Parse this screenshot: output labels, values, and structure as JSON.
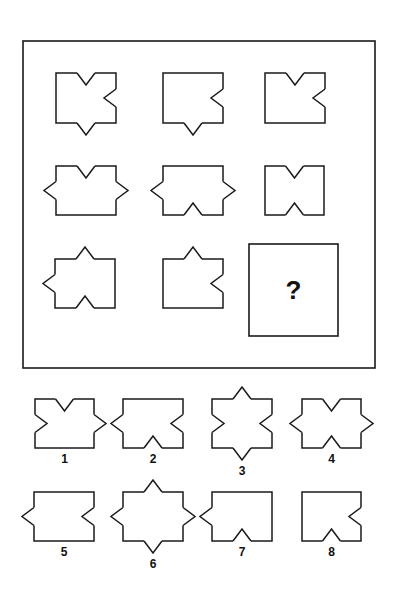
{
  "puzzle": {
    "stroke_color": "#1a1a1a",
    "background": "#ffffff",
    "question_mark": "?",
    "frame": {
      "x": 23,
      "y": 41,
      "w": 352,
      "h": 327
    },
    "question_box": {
      "x": 249,
      "y": 244,
      "w": 89,
      "h": 92
    },
    "matrix": [
      {
        "row": 1,
        "col": 1,
        "x": 56,
        "y": 73,
        "w": 60,
        "h": 50,
        "marks": [
          "top-in",
          "right-in",
          "bottom-out"
        ]
      },
      {
        "row": 1,
        "col": 2,
        "x": 163,
        "y": 73,
        "w": 60,
        "h": 50,
        "marks": [
          "right-in",
          "bottom-out"
        ]
      },
      {
        "row": 1,
        "col": 3,
        "x": 265,
        "y": 73,
        "w": 60,
        "h": 50,
        "marks": [
          "top-in",
          "right-in"
        ]
      },
      {
        "row": 2,
        "col": 1,
        "x": 56,
        "y": 166,
        "w": 60,
        "h": 49,
        "marks": [
          "top-in",
          "left-out",
          "right-out"
        ]
      },
      {
        "row": 2,
        "col": 2,
        "x": 163,
        "y": 166,
        "w": 60,
        "h": 49,
        "marks": [
          "left-out",
          "right-out",
          "bottom-in"
        ]
      },
      {
        "row": 2,
        "col": 3,
        "x": 265,
        "y": 166,
        "w": 59,
        "h": 49,
        "marks": [
          "top-in",
          "bottom-in"
        ]
      },
      {
        "row": 3,
        "col": 1,
        "x": 55,
        "y": 259,
        "w": 60,
        "h": 49,
        "marks": [
          "top-out",
          "left-out",
          "bottom-in"
        ]
      },
      {
        "row": 3,
        "col": 2,
        "x": 163,
        "y": 259,
        "w": 60,
        "h": 49,
        "marks": [
          "top-out",
          "right-in"
        ]
      }
    ],
    "options": [
      {
        "label": "1",
        "x": 35,
        "y": 399,
        "w": 59,
        "h": 49,
        "marks": [
          "top-in",
          "left-in",
          "right-out"
        ]
      },
      {
        "label": "2",
        "x": 123,
        "y": 399,
        "w": 60,
        "h": 49,
        "marks": [
          "left-out",
          "right-in",
          "bottom-in"
        ]
      },
      {
        "label": "3",
        "x": 212,
        "y": 399,
        "w": 60,
        "h": 49,
        "marks": [
          "top-out",
          "left-in",
          "right-in",
          "bottom-out"
        ]
      },
      {
        "label": "4",
        "x": 302,
        "y": 399,
        "w": 59,
        "h": 49,
        "marks": [
          "top-in",
          "left-out",
          "right-out",
          "bottom-in"
        ]
      },
      {
        "label": "5",
        "x": 34,
        "y": 492,
        "w": 60,
        "h": 49,
        "marks": [
          "left-out",
          "right-in"
        ]
      },
      {
        "label": "6",
        "x": 123,
        "y": 492,
        "w": 60,
        "h": 49,
        "marks": [
          "top-out",
          "left-out",
          "right-out",
          "bottom-out"
        ]
      },
      {
        "label": "7",
        "x": 212,
        "y": 492,
        "w": 60,
        "h": 49,
        "marks": [
          "left-out",
          "bottom-in"
        ]
      },
      {
        "label": "8",
        "x": 302,
        "y": 492,
        "w": 59,
        "h": 49,
        "marks": [
          "right-in",
          "bottom-in"
        ]
      }
    ]
  }
}
